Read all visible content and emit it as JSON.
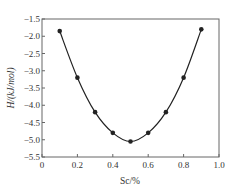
{
  "chart_data": {
    "type": "line",
    "title": "",
    "xlabel": "Sc/%",
    "ylabel": "H/(kJ/mol)",
    "xlim": [
      0,
      1.0
    ],
    "ylim": [
      -5.5,
      -1.5
    ],
    "grid": false,
    "legend": null,
    "x_ticks": [
      "0",
      "0.2",
      "0.4",
      "0.6",
      "0.8",
      "1.0"
    ],
    "y_ticks": [
      "-1.5",
      "-2.0",
      "-2.5",
      "-3.0",
      "-3.5",
      "-4.0",
      "-4.5",
      "-5.0",
      "-5.5"
    ],
    "series": [
      {
        "name": "H",
        "x": [
          0.1,
          0.2,
          0.3,
          0.4,
          0.5,
          0.6,
          0.7,
          0.8,
          0.9
        ],
        "values": [
          -1.85,
          -3.2,
          -4.2,
          -4.8,
          -5.05,
          -4.8,
          -4.2,
          -3.2,
          -1.8
        ],
        "marker": "circle",
        "color": "#222222"
      }
    ]
  }
}
